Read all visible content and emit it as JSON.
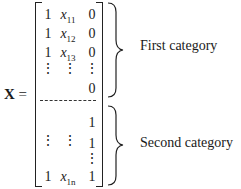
{
  "equation": {
    "lhs": "X",
    "equals": "=",
    "matrix": {
      "rows_top": [
        [
          "1",
          "x",
          "0"
        ],
        [
          "1",
          "x",
          "0"
        ],
        [
          "1",
          "x",
          "0"
        ]
      ],
      "subscripts_top": [
        "11",
        "12",
        "13"
      ],
      "row_dots_top": [
        "⋮",
        "⋮",
        "⋮"
      ],
      "row_last_top": "0",
      "separator": "dashed",
      "rows_bottom_first": "1",
      "row_mid_bottom": [
        "⋮",
        "⋮",
        "1"
      ],
      "row_dots_bottom": "⋮",
      "row_last_bottom": [
        "1",
        "x",
        "1"
      ],
      "subscript_last": "1n"
    },
    "braces": [
      {
        "label": "First category"
      },
      {
        "label": "Second category"
      }
    ]
  }
}
